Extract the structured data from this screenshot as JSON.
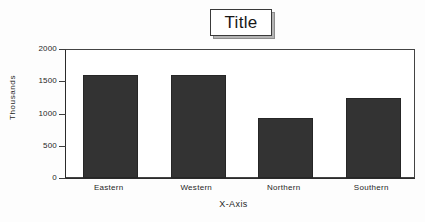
{
  "title": {
    "text": "Title"
  },
  "axes": {
    "y_title": "Thousands",
    "x_title": "X-Axis",
    "y_ticks": [
      "2000",
      "1500",
      "1000",
      "500",
      "0"
    ]
  },
  "colors": {
    "bar_fill": "#333333",
    "bar_edge": "#262626",
    "axis": "#2b2b2b",
    "text": "#1f1f1f",
    "plot_background": "#ffffff",
    "figure_background": "#fdfdfd",
    "title_box_border": "#3a3a3a",
    "title_box_shadow": "#8d8d8d"
  },
  "chart_data": {
    "type": "bar",
    "title": "Title",
    "xlabel": "X-Axis",
    "ylabel": "Thousands",
    "categories": [
      "Eastern",
      "Western",
      "Northern",
      "Southern"
    ],
    "values": [
      1590,
      1600,
      930,
      1240
    ],
    "ylim": [
      0,
      2000
    ],
    "yticks": [
      0,
      500,
      1000,
      1500,
      2000
    ],
    "grid": false,
    "legend": false
  }
}
